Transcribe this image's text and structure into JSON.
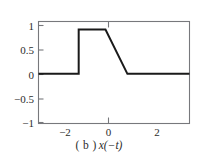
{
  "figure": {
    "caption_label": "( b )",
    "caption_expression": "x(−t)",
    "caption_full": "( b ) x(−t)"
  },
  "colors": {
    "signal": "#1a1a1a",
    "axis": "#77787c",
    "text": "#2c2c2c",
    "background": "#ffffff"
  },
  "chart_data": {
    "type": "line",
    "xlabel": "",
    "ylabel": "",
    "xlim": [
      -2.85,
      3.35
    ],
    "ylim": [
      -1.12,
      1.18
    ],
    "grid": false,
    "legend": null,
    "x_ticks": [
      -2,
      0,
      2
    ],
    "x_tick_labels": [
      "−2",
      "0",
      "2"
    ],
    "y_ticks": [
      1,
      0.5,
      0,
      -0.5,
      -1
    ],
    "y_tick_labels": [
      "1",
      "0.5",
      "0",
      "−0.5",
      "−1"
    ],
    "series": [
      {
        "name": "x(−t)",
        "x": [
          -2.85,
          -1.2,
          -1.2,
          -0.1,
          0.8,
          3.35
        ],
        "y": [
          0,
          0,
          1,
          1,
          0,
          0
        ]
      }
    ],
    "annotations": [
      "Signal is 0 for t < -1.2",
      "Step up to amplitude 1 at t = -1.2",
      "Constant amplitude 1 from t = -1.2 to t = -0.1",
      "Linear ramp down from 1 to 0 between t = -0.1 and t = 0.8",
      "Signal is 0 for t > 0.8"
    ]
  }
}
